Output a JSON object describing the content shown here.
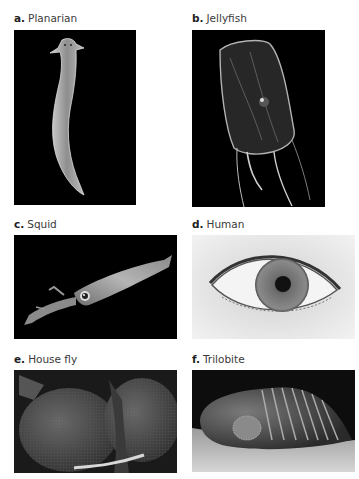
{
  "figure": {
    "panels": [
      {
        "letter": "a.",
        "name": "Planarian",
        "background": "#000000"
      },
      {
        "letter": "b.",
        "name": "Jellyfish",
        "background": "#000000"
      },
      {
        "letter": "c.",
        "name": "Squid",
        "background": "#000000"
      },
      {
        "letter": "d.",
        "name": "Human",
        "background": "#e6e6e6"
      },
      {
        "letter": "e.",
        "name": "House fly",
        "background": "#1a1a1a"
      },
      {
        "letter": "f.",
        "name": "Trilobite",
        "background": "#0d0d0d"
      }
    ]
  }
}
